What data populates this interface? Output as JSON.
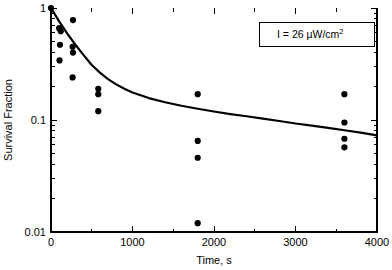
{
  "chart_data": {
    "type": "scatter",
    "title": "",
    "xlabel": "Time, s",
    "ylabel": "Survival Fraction",
    "xlim": [
      0,
      4000
    ],
    "ylim": [
      0.01,
      1
    ],
    "yscale": "log",
    "xscale": "linear",
    "grid": false,
    "legend_position": "top-right",
    "x_major_ticks": [
      0,
      1000,
      2000,
      3000,
      4000
    ],
    "x_tick_labels": [
      "0",
      "1000",
      "2000",
      "3000",
      "4000"
    ],
    "x_minor_ticks": [
      500,
      1500,
      2500,
      3500
    ],
    "y_major_ticks": [
      0.01,
      0.1,
      1
    ],
    "y_tick_labels": [
      "0.01",
      "0.1",
      "1"
    ],
    "y_minor_ticks": [
      0.02,
      0.03,
      0.04,
      0.05,
      0.06,
      0.07,
      0.08,
      0.09,
      0.2,
      0.3,
      0.4,
      0.5,
      0.6,
      0.7,
      0.8,
      0.9
    ],
    "annotation": {
      "text": "I = 26 µW/cm",
      "superscript": "2",
      "full_text": "I = 26 µW/cm²"
    },
    "series": [
      {
        "name": "Measured survival fraction",
        "marker": "filled-circle",
        "color": "#000000",
        "points": [
          {
            "x": 0,
            "y": 1.0
          },
          {
            "x": 100,
            "y": 0.66
          },
          {
            "x": 120,
            "y": 0.62
          },
          {
            "x": 110,
            "y": 0.47
          },
          {
            "x": 105,
            "y": 0.34
          },
          {
            "x": 270,
            "y": 0.78
          },
          {
            "x": 265,
            "y": 0.45
          },
          {
            "x": 270,
            "y": 0.4
          },
          {
            "x": 265,
            "y": 0.24
          },
          {
            "x": 580,
            "y": 0.19
          },
          {
            "x": 580,
            "y": 0.17
          },
          {
            "x": 580,
            "y": 0.12
          },
          {
            "x": 1800,
            "y": 0.17
          },
          {
            "x": 1800,
            "y": 0.065
          },
          {
            "x": 1800,
            "y": 0.046
          },
          {
            "x": 1800,
            "y": 0.012
          },
          {
            "x": 3600,
            "y": 0.17
          },
          {
            "x": 3600,
            "y": 0.095
          },
          {
            "x": 3600,
            "y": 0.068
          },
          {
            "x": 3600,
            "y": 0.057
          }
        ]
      }
    ],
    "fit_curve": {
      "name": "Fitted decay curve",
      "color": "#000000",
      "points": [
        {
          "x": 0,
          "y": 1.0
        },
        {
          "x": 100,
          "y": 0.76
        },
        {
          "x": 200,
          "y": 0.59
        },
        {
          "x": 300,
          "y": 0.47
        },
        {
          "x": 400,
          "y": 0.38
        },
        {
          "x": 500,
          "y": 0.31
        },
        {
          "x": 600,
          "y": 0.265
        },
        {
          "x": 700,
          "y": 0.232
        },
        {
          "x": 800,
          "y": 0.208
        },
        {
          "x": 900,
          "y": 0.19
        },
        {
          "x": 1000,
          "y": 0.176
        },
        {
          "x": 1200,
          "y": 0.157
        },
        {
          "x": 1400,
          "y": 0.144
        },
        {
          "x": 1600,
          "y": 0.134
        },
        {
          "x": 1800,
          "y": 0.126
        },
        {
          "x": 2000,
          "y": 0.119
        },
        {
          "x": 2200,
          "y": 0.113
        },
        {
          "x": 2400,
          "y": 0.108
        },
        {
          "x": 2600,
          "y": 0.103
        },
        {
          "x": 2800,
          "y": 0.098
        },
        {
          "x": 3000,
          "y": 0.093
        },
        {
          "x": 3200,
          "y": 0.089
        },
        {
          "x": 3400,
          "y": 0.085
        },
        {
          "x": 3600,
          "y": 0.081
        },
        {
          "x": 3800,
          "y": 0.077
        },
        {
          "x": 4000,
          "y": 0.073
        }
      ]
    }
  }
}
